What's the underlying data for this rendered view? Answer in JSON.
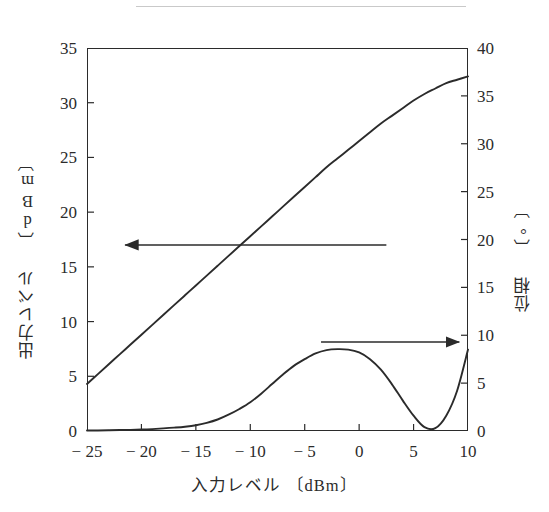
{
  "page": {
    "header_text": "",
    "has_header_rule": true
  },
  "chart_data": {
    "type": "line",
    "title": "",
    "xlabel": "入力レベル 〔dBm〕",
    "ylabel": "出力レベル 〔dBm〕",
    "y2label": "位相 〔°〕",
    "xlim": [
      -25,
      10
    ],
    "ylim": [
      0,
      35
    ],
    "y2lim": [
      0,
      40
    ],
    "xticks": [
      -25,
      -20,
      -15,
      -10,
      -5,
      0,
      5,
      10
    ],
    "xticklabels": [
      "− 25",
      "− 20",
      "− 15",
      "− 10",
      "− 5",
      "0",
      "5",
      "10"
    ],
    "yticks": [
      0,
      5,
      10,
      15,
      20,
      25,
      30,
      35
    ],
    "yticklabels": [
      "0",
      "5",
      "10",
      "15",
      "20",
      "25",
      "30",
      "35"
    ],
    "y2ticks": [
      0,
      5,
      10,
      15,
      20,
      25,
      30,
      35,
      40
    ],
    "y2ticklabels": [
      "0",
      "5",
      "10",
      "15",
      "20",
      "25",
      "30",
      "35",
      "40"
    ],
    "grid": false,
    "legend": "none",
    "line_color": "#2b2b2b",
    "series": [
      {
        "name": "出力レベル",
        "axis": "left",
        "x": [
          -25,
          -24,
          -23,
          -22,
          -21,
          -20,
          -19,
          -18,
          -17,
          -16,
          -15,
          -14,
          -13,
          -12,
          -11,
          -10,
          -9,
          -8,
          -7,
          -6,
          -5,
          -4,
          -3,
          -2,
          -1,
          0,
          1,
          2,
          3,
          4,
          5,
          6,
          7,
          8,
          9,
          10
        ],
        "values": [
          4.3,
          5.2,
          6.1,
          7.0,
          7.9,
          8.8,
          9.7,
          10.6,
          11.5,
          12.4,
          13.3,
          14.2,
          15.1,
          16.0,
          16.9,
          17.8,
          18.7,
          19.6,
          20.5,
          21.4,
          22.3,
          23.2,
          24.1,
          24.9,
          25.7,
          26.5,
          27.3,
          28.1,
          28.8,
          29.5,
          30.2,
          30.8,
          31.3,
          31.8,
          32.1,
          32.4
        ]
      },
      {
        "name": "位相",
        "axis": "right",
        "x": [
          -25,
          -24,
          -23,
          -22,
          -21,
          -20,
          -19,
          -18,
          -17,
          -16,
          -15,
          -14,
          -13,
          -12,
          -11,
          -10,
          -9,
          -8,
          -7,
          -6,
          -5,
          -4,
          -3,
          -2,
          -1,
          0,
          1,
          2,
          3,
          4,
          5,
          6,
          7,
          8,
          9,
          10
        ],
        "values": [
          0.05,
          0.06,
          0.08,
          0.1,
          0.12,
          0.15,
          0.2,
          0.27,
          0.35,
          0.45,
          0.6,
          0.85,
          1.2,
          1.7,
          2.3,
          3.0,
          3.9,
          4.9,
          5.9,
          6.8,
          7.5,
          8.1,
          8.45,
          8.55,
          8.5,
          8.2,
          7.5,
          6.4,
          4.9,
          3.2,
          1.6,
          0.4,
          0.3,
          1.6,
          4.2,
          8.5
        ]
      }
    ],
    "annotations": [
      {
        "name": "arrow-to-left-axis",
        "direction": "left",
        "x_start": 2.5,
        "x_end": -21.5,
        "y_value": 17.0,
        "axis": "left"
      },
      {
        "name": "arrow-to-right-axis",
        "direction": "right",
        "x_start": -3.5,
        "x_end": 9.2,
        "y_value": 9.3,
        "axis": "right"
      }
    ]
  }
}
